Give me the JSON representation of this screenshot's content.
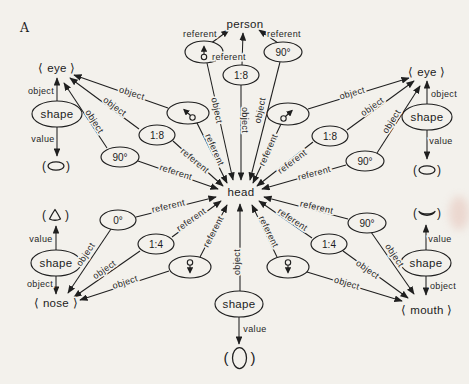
{
  "figure_label": "A",
  "nodes": {
    "person": "person",
    "head": "head",
    "eye_left": "⟨ eye ⟩",
    "eye_right": "⟨ eye ⟩",
    "nose": "⟨ nose ⟩",
    "mouth": "⟨ mouth ⟩",
    "shape": "shape"
  },
  "attributes": {
    "ratio_1_8": "1:8",
    "ratio_1_4": "1:4",
    "angle_90": "90°",
    "angle_0": "0°"
  },
  "relations": {
    "referent": "referent",
    "object": "object",
    "value": "value"
  },
  "glyph_wrappers": {
    "open": "(",
    "close": ")"
  },
  "icons": [
    "direction-up-icon",
    "direction-up-left-icon",
    "direction-up-right-icon",
    "direction-down-icon",
    "eye-shape-glyph",
    "nose-shape-glyph",
    "mouth-shape-glyph",
    "head-shape-glyph"
  ],
  "network": {
    "description": "semantic network: attribute nodes point with referent arrows to person/head and with object arrows to body parts; shape nodes link parts to drawn value glyphs",
    "edges": [
      {
        "from": "direction-up",
        "to": "person",
        "label": "referent"
      },
      {
        "from": "1:8-top",
        "to": "person",
        "label": "referent"
      },
      {
        "from": "90-top",
        "to": "person",
        "label": "referent"
      },
      {
        "from": "direction-up",
        "to": "head",
        "label": "object"
      },
      {
        "from": "1:8-top",
        "to": "head",
        "label": "object"
      },
      {
        "from": "90-top",
        "to": "head",
        "label": "object"
      },
      {
        "from": "direction-up-left",
        "to": "head",
        "label": "referent"
      },
      {
        "from": "1:8-left",
        "to": "head",
        "label": "referent"
      },
      {
        "from": "90-left",
        "to": "head",
        "label": "referent"
      },
      {
        "from": "0-bottom-left",
        "to": "head",
        "label": "referent"
      },
      {
        "from": "1:4-bottom-left",
        "to": "head",
        "label": "referent"
      },
      {
        "from": "direction-down-left",
        "to": "head",
        "label": "referent"
      },
      {
        "from": "direction-up-right",
        "to": "head",
        "label": "referent"
      },
      {
        "from": "1:8-right",
        "to": "head",
        "label": "referent"
      },
      {
        "from": "90-right-upper",
        "to": "head",
        "label": "referent"
      },
      {
        "from": "90-right-lower",
        "to": "head",
        "label": "referent"
      },
      {
        "from": "1:4-bottom-right",
        "to": "head",
        "label": "referent"
      },
      {
        "from": "direction-down-right",
        "to": "head",
        "label": "referent"
      },
      {
        "from": "shape-bottom-center",
        "to": "head",
        "label": "object"
      },
      {
        "from": "shape-eye-left",
        "to": "eye-left",
        "label": "object"
      },
      {
        "from": "direction-up-left",
        "to": "eye-left",
        "label": "object"
      },
      {
        "from": "1:8-left",
        "to": "eye-left",
        "label": "object"
      },
      {
        "from": "90-left",
        "to": "eye-left",
        "label": "object"
      },
      {
        "from": "shape-eye-right",
        "to": "eye-right",
        "label": "object"
      },
      {
        "from": "direction-up-right",
        "to": "eye-right",
        "label": "object"
      },
      {
        "from": "1:8-right",
        "to": "eye-right",
        "label": "object"
      },
      {
        "from": "90-right-upper",
        "to": "eye-right",
        "label": "object"
      },
      {
        "from": "shape-nose",
        "to": "nose",
        "label": "object"
      },
      {
        "from": "0-bottom-left",
        "to": "nose",
        "label": "object"
      },
      {
        "from": "1:4-bottom-left",
        "to": "nose",
        "label": "object"
      },
      {
        "from": "direction-down-left",
        "to": "nose",
        "label": "object"
      },
      {
        "from": "shape-mouth",
        "to": "mouth",
        "label": "object"
      },
      {
        "from": "90-right-lower",
        "to": "mouth",
        "label": "object"
      },
      {
        "from": "1:4-bottom-right",
        "to": "mouth",
        "label": "object"
      },
      {
        "from": "direction-down-right",
        "to": "mouth",
        "label": "object"
      },
      {
        "from": "shape-eye-left",
        "to": "eye-ellipse-glyph",
        "label": "value"
      },
      {
        "from": "shape-eye-right",
        "to": "eye-ellipse-glyph",
        "label": "value"
      },
      {
        "from": "shape-nose",
        "to": "nose-triangle-glyph",
        "label": "value"
      },
      {
        "from": "shape-mouth",
        "to": "mouth-crescent-glyph",
        "label": "value"
      },
      {
        "from": "shape-bottom-center",
        "to": "head-oval-glyph",
        "label": "value"
      }
    ]
  },
  "colors": {
    "ink": "#1f1f1f",
    "paper": "#f3f1ec",
    "smudge": "#e2b9ae"
  }
}
